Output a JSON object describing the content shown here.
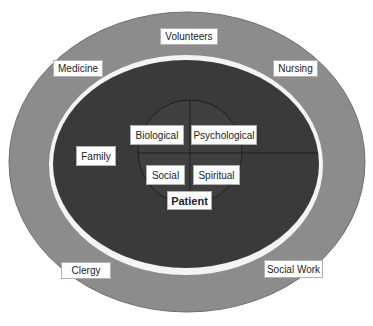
{
  "diagram": {
    "type": "nested-ellipses",
    "colors": {
      "outer_ring": "#8c8c8c",
      "separator_ring": "#ffffff",
      "inner_field": "#3a3a3a",
      "core_lines": "#1e1e1e",
      "label_bg": "#ffffff"
    },
    "outer_ring": {
      "labels": [
        "Volunteers",
        "Medicine",
        "Nursing",
        "Clergy",
        "Social Work"
      ]
    },
    "inner_field": {
      "labels": [
        "Family"
      ]
    },
    "core": {
      "quadrants": [
        "Biological",
        "Psychological",
        "Social",
        "Spiritual"
      ],
      "center_label": "Patient"
    }
  }
}
